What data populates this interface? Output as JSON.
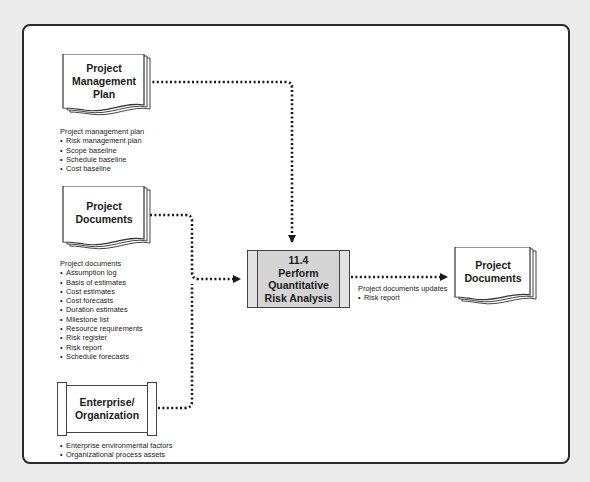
{
  "diagram": {
    "inputs": [
      {
        "id": "project-management-plan",
        "title": "Project\nManagement\nPlan",
        "caption_heading": "Project management plan",
        "items": [
          "Risk management plan",
          "Scope baseline",
          "Schedule baseline",
          "Cost baseline"
        ]
      },
      {
        "id": "project-documents",
        "title": "Project\nDocuments",
        "caption_heading": "Project documents",
        "items": [
          "Assumption log",
          "Basis of estimates",
          "Cost estimates",
          "Cost forecasts",
          "Duration estimates",
          "Milestone list",
          "Resource requirements",
          "Risk register",
          "Risk report",
          "Schedule forecasts"
        ]
      },
      {
        "id": "enterprise-organization",
        "title": "Enterprise/\nOrganization",
        "items": [
          "Enterprise environmental factors",
          "Organizational process assets"
        ]
      }
    ],
    "process": {
      "number": "11.4",
      "title": "11.4\nPerform\nQuantitative\nRisk Analysis"
    },
    "output_flow": {
      "caption_heading": "Project documents updates",
      "items": [
        "Risk report"
      ]
    },
    "outputs": [
      {
        "id": "project-documents-out",
        "title": "Project\nDocuments"
      }
    ],
    "colors": {
      "background": "#ebebeb",
      "frame": "#ffffff",
      "stroke": "#2b2b2b",
      "process_fill": "#d4d4d4",
      "connector": "#1a1a1a"
    }
  }
}
